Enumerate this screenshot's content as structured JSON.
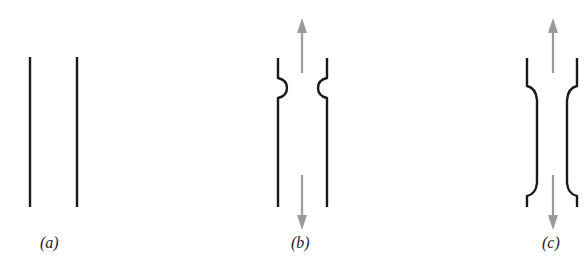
{
  "figure": {
    "panels": [
      {
        "id": "a",
        "label": "(a)",
        "description": "two straight parallel walls"
      },
      {
        "id": "b",
        "label": "(b)",
        "description": "walls with local circular notches near top, under tension arrows"
      },
      {
        "id": "c",
        "label": "(c)",
        "description": "walls with reduced gauge section (necked), under tension arrows"
      }
    ],
    "colors": {
      "wall": "#1a1a1a",
      "arrow": "#9a9a9a",
      "background": "#ffffff"
    }
  }
}
